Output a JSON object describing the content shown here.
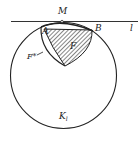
{
  "figure": {
    "labels": {
      "M": "M",
      "A": "A",
      "B": "B",
      "l": "l",
      "F": "F",
      "F_star": "F*",
      "K": "K",
      "K_sub": "l"
    },
    "colors": {
      "ink": "#222222",
      "background": "#ffffff"
    }
  }
}
